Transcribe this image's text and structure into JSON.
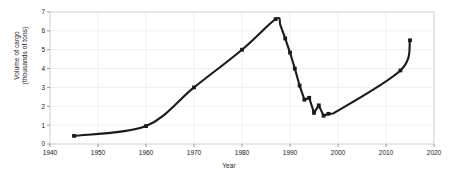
{
  "chart_data": {
    "type": "line",
    "title": "",
    "xlabel": "Year",
    "ylabel_line1": "Volume of cargo",
    "ylabel_line2": "(thousands of tons)",
    "xlim": [
      1940,
      2020
    ],
    "ylim": [
      0,
      7
    ],
    "xticks": [
      1940,
      1950,
      1960,
      1970,
      1980,
      1990,
      2000,
      2010,
      2020
    ],
    "xticklabels": [
      "1940",
      "1950",
      "1960",
      "1970",
      "1980",
      "1990",
      "2000",
      "2010",
      "2020"
    ],
    "yticks": [
      0,
      1,
      2,
      3,
      4,
      5,
      6,
      7
    ],
    "yticklabels": [
      "0",
      "1",
      "2",
      "3",
      "4",
      "5",
      "6",
      "7"
    ],
    "grid": true,
    "legend": false,
    "line_color": "#1a1a1a",
    "grid_color": "#e8e8e8",
    "marker": "square",
    "series": [
      {
        "name": "Volume of cargo",
        "x": [
          1945,
          1960,
          1970,
          1980,
          1987,
          1988,
          1989,
          1990,
          1991,
          1992,
          1993,
          1994,
          1995,
          1996,
          1997,
          1998,
          1999,
          2013,
          2015
        ],
        "values": [
          0.43,
          0.95,
          3.0,
          5.0,
          6.62,
          6.3,
          5.6,
          4.85,
          4.0,
          3.1,
          2.35,
          2.45,
          1.65,
          2.05,
          1.5,
          1.6,
          1.62,
          3.9,
          5.5
        ],
        "marker_points_x": [
          1945,
          1960,
          1970,
          1980,
          1987,
          1989,
          1990,
          1991,
          1992,
          1993,
          1994,
          1995,
          1996,
          1997,
          1998,
          2013,
          2015
        ],
        "marker_points_y": [
          0.43,
          0.95,
          3.0,
          5.0,
          6.62,
          5.6,
          4.85,
          4.0,
          3.1,
          2.35,
          2.45,
          1.65,
          2.05,
          1.5,
          1.6,
          3.9,
          5.5
        ]
      }
    ]
  }
}
